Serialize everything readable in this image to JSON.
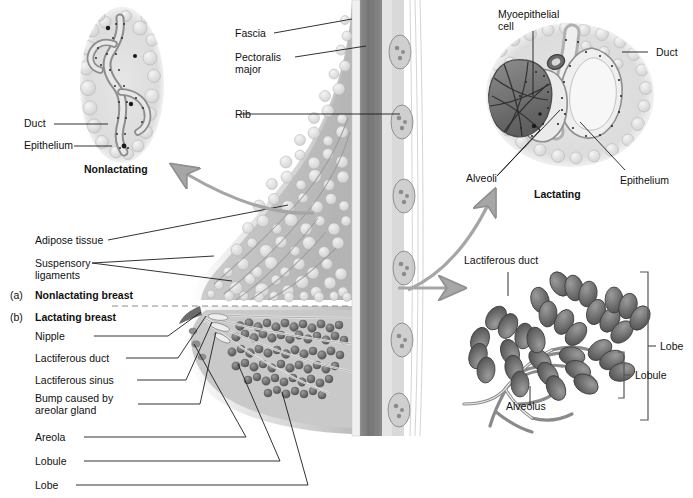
{
  "figure": {
    "kind": "anatomical-illustration",
    "background_color": "#ffffff",
    "ink_color": "#111111",
    "arrow_color": "#9a9a9a"
  },
  "panels": {
    "a_key": "(a)",
    "a_label": "Nonlactating breast",
    "b_key": "(b)",
    "b_label": "Lactating breast"
  },
  "inset_nonlactating": {
    "caption": "Nonlactating",
    "labels": [
      {
        "text": "Duct"
      },
      {
        "text": "Epithelium"
      }
    ]
  },
  "inset_lactating": {
    "caption": "Lactating",
    "labels": [
      {
        "text": "Myoepithelial\ncell"
      },
      {
        "text": "Duct"
      },
      {
        "text": "Alveoli"
      },
      {
        "text": "Epithelium"
      }
    ]
  },
  "cross_section": {
    "labels_upper": [
      {
        "text": "Fascia"
      },
      {
        "text": "Pectoralis\nmajor"
      },
      {
        "text": "Rib"
      },
      {
        "text": "Adipose tissue"
      },
      {
        "text": "Suspensory\nligaments"
      }
    ],
    "labels_lower": [
      {
        "text": "Nipple"
      },
      {
        "text": "Lactiferous duct"
      },
      {
        "text": "Lactiferous sinus"
      },
      {
        "text": "Bump caused by\nareolar gland"
      },
      {
        "text": "Areola"
      },
      {
        "text": "Lobule"
      },
      {
        "text": "Lobe"
      }
    ]
  },
  "inset_lobe": {
    "labels": [
      {
        "text": "Lactiferous duct"
      },
      {
        "text": "Alveolus"
      },
      {
        "text": "Lobule"
      },
      {
        "text": "Lobe"
      }
    ]
  }
}
